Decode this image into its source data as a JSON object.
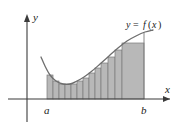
{
  "figure": {
    "kind": "riemann-sum-diagram",
    "caption_text": "",
    "background_color": "#ffffff"
  },
  "axes": {
    "y_axis_label": "y",
    "x_axis_label": "x",
    "axis_color": "#3b3b3b",
    "origin_px": {
      "x": 27,
      "y": 99
    }
  },
  "bounds": {
    "lower_label": "a",
    "upper_label": "b",
    "lower_x_px": 47,
    "upper_x_px": 144
  },
  "curve": {
    "label_y": "y",
    "label_equals": "=",
    "label_f": "f",
    "label_open": "(",
    "label_var": "x",
    "label_close": ")",
    "label_full": "y = f(x)",
    "color": "#6e6e6e"
  },
  "region": {
    "fill_color": "#b8b8b8",
    "edge_color": "#7a7a7a",
    "rectangle_count": 13
  },
  "chart_data": {
    "type": "area",
    "title": "",
    "xlabel": "x",
    "ylabel": "y",
    "grid": false,
    "legend": null,
    "annotations": [
      "y = f(x)",
      "a",
      "b"
    ],
    "xlim": [
      27,
      175
    ],
    "ylim": [
      99,
      20
    ],
    "curve_points_px": [
      {
        "x": 41,
        "y": 57
      },
      {
        "x": 45,
        "y": 66
      },
      {
        "x": 50,
        "y": 75
      },
      {
        "x": 56,
        "y": 81
      },
      {
        "x": 63,
        "y": 84
      },
      {
        "x": 70,
        "y": 84
      },
      {
        "x": 77,
        "y": 81
      },
      {
        "x": 84,
        "y": 77
      },
      {
        "x": 92,
        "y": 71
      },
      {
        "x": 100,
        "y": 64
      },
      {
        "x": 109,
        "y": 56
      },
      {
        "x": 118,
        "y": 48
      },
      {
        "x": 127,
        "y": 41
      },
      {
        "x": 136,
        "y": 36
      },
      {
        "x": 145,
        "y": 32
      },
      {
        "x": 153,
        "y": 30
      }
    ],
    "rectangles_px": [
      {
        "x": 47,
        "width": 6,
        "top": 75,
        "bottom": 99
      },
      {
        "x": 53,
        "width": 6,
        "top": 81,
        "bottom": 99
      },
      {
        "x": 59,
        "width": 6,
        "top": 84,
        "bottom": 99
      },
      {
        "x": 65,
        "width": 6,
        "top": 84,
        "bottom": 99
      },
      {
        "x": 71,
        "width": 6,
        "top": 84,
        "bottom": 99
      },
      {
        "x": 77,
        "width": 6,
        "top": 81,
        "bottom": 99
      },
      {
        "x": 83,
        "width": 6,
        "top": 78,
        "bottom": 99
      },
      {
        "x": 89,
        "width": 6,
        "top": 73,
        "bottom": 99
      },
      {
        "x": 95,
        "width": 6,
        "top": 68,
        "bottom": 99
      },
      {
        "x": 101,
        "width": 7,
        "top": 63,
        "bottom": 99
      },
      {
        "x": 108,
        "width": 7,
        "top": 57,
        "bottom": 99
      },
      {
        "x": 115,
        "width": 7,
        "top": 50,
        "bottom": 99
      },
      {
        "x": 122,
        "width": 22,
        "top": 43,
        "bottom": 99
      }
    ]
  }
}
